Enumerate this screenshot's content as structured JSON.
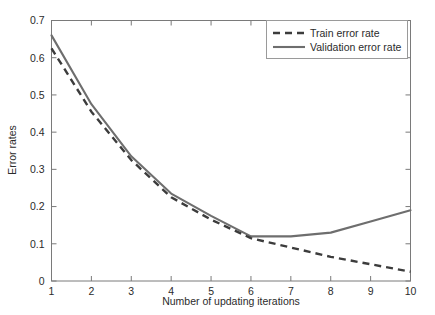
{
  "chart_data": {
    "type": "line",
    "title": "",
    "xlabel": "Number of updating iterations",
    "ylabel": "Error rates",
    "x": [
      1,
      2,
      3,
      4,
      5,
      6,
      7,
      8,
      9,
      10
    ],
    "xlim": [
      1,
      10
    ],
    "ylim": [
      0,
      0.7
    ],
    "xticks": [
      1,
      2,
      3,
      4,
      5,
      6,
      7,
      8,
      9,
      10
    ],
    "xticklabels": [
      "1",
      "2",
      "3",
      "4",
      "5",
      "6",
      "7",
      "8",
      "9",
      "10"
    ],
    "yticks": [
      0,
      0.1,
      0.2,
      0.3,
      0.4,
      0.5,
      0.6,
      0.7
    ],
    "yticklabels": [
      "0",
      "0.1",
      "0.2",
      "0.3",
      "0.4",
      "0.5",
      "0.6",
      "0.7"
    ],
    "grid": false,
    "legend_position": "upper right",
    "series": [
      {
        "name": "Train error rate",
        "style": "dashed",
        "color": "#3c3c3c",
        "values": [
          0.625,
          0.455,
          0.325,
          0.225,
          0.165,
          0.115,
          0.09,
          0.065,
          0.045,
          0.025
        ]
      },
      {
        "name": "Validation error rate",
        "style": "solid",
        "color": "#6e6e6e",
        "values": [
          0.66,
          0.475,
          0.335,
          0.235,
          0.175,
          0.12,
          0.12,
          0.13,
          0.16,
          0.19
        ]
      }
    ]
  },
  "axes": {
    "ylabel": "Error rates",
    "xlabel": "Number of updating iterations"
  },
  "legend": {
    "entries": [
      {
        "label": "Train error rate"
      },
      {
        "label": "Validation error rate"
      }
    ]
  },
  "colors": {
    "background": "#ffffff",
    "axis": "#7a7a7a",
    "text": "#2b2b2b",
    "train": "#3c3c3c",
    "validation": "#6e6e6e",
    "legend_border": "#9a9a9a"
  }
}
